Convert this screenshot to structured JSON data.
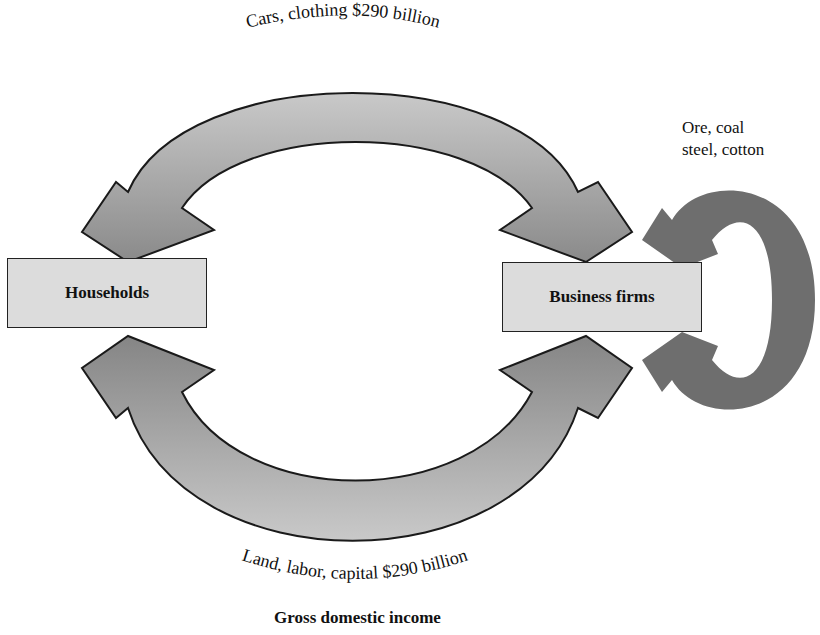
{
  "diagram": {
    "nodes": {
      "households": {
        "label": "Households"
      },
      "firms": {
        "label": "Business firms"
      }
    },
    "flows": {
      "top": {
        "label": "Cars, clothing $290 billion",
        "from": "Business firms",
        "to": "Households"
      },
      "bottom": {
        "label": "Land, labor, capital $290 billion",
        "from": "Households",
        "to": "Business firms"
      },
      "self_loop": {
        "line1": "Ore, coal",
        "line2": "steel, cotton",
        "from": "Business firms",
        "to": "Business firms"
      }
    },
    "caption": "Gross domestic income",
    "colors": {
      "arc_fill_light": "#c8c8c8",
      "arc_fill_dark": "#8c8c8c",
      "loop_fill": "#6e6e6e",
      "box_fill": "#dcdcdc",
      "outline": "#1a1a1a"
    }
  }
}
